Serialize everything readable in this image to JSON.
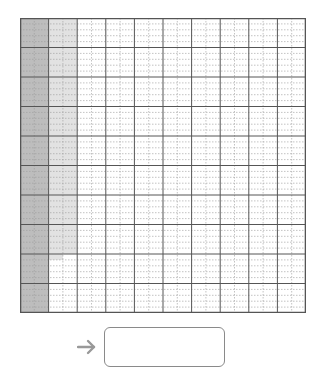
{
  "diagram": {
    "type": "thousand-grid",
    "major_columns": 10,
    "major_rows": 10,
    "sub_columns_per_cell": 2,
    "sub_rows_per_cell": 5,
    "total_small_cells": 1000,
    "colors": {
      "background": "#ffffff",
      "major_line": "#555555",
      "minor_line": "#9a9a9a",
      "dark_shade": "#bdbdbd",
      "light_shade": "#e2e2e2",
      "arrow": "#999999",
      "box_border": "#8a8a8a"
    },
    "shading": {
      "dark_region": {
        "description": "Entire first major column shaded dark gray",
        "major_column": 1,
        "small_cells": 100
      },
      "light_region": {
        "description": "Second major column shaded light gray, partially filled",
        "major_column": 2,
        "left_sub_column_rows_shaded": 41,
        "right_sub_column_rows_shaded": 40
      }
    }
  },
  "answer": {
    "arrow_icon": "right-arrow-icon",
    "value": "",
    "placeholder": ""
  }
}
